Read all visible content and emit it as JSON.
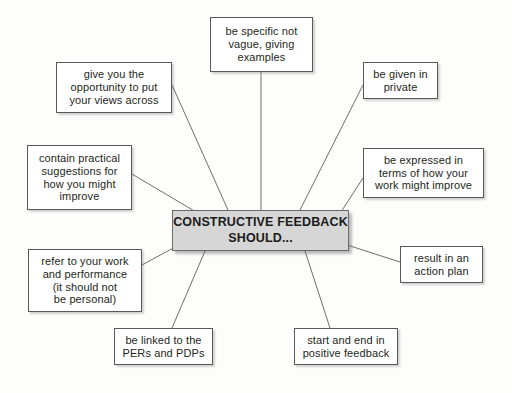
{
  "diagram": {
    "type": "radial-mind-map",
    "background_color": "#fdfdfc",
    "center": {
      "label": "CONSTRUCTIVE FEEDBACK\nSHOULD...",
      "fill_color": "#d6d6d6",
      "border_color": "#6a6a6c",
      "text_color": "#1b1b1b"
    },
    "node_style": {
      "fill_color": "#ffffff",
      "border_color": "#58585a",
      "text_color": "#231f20",
      "connector_color": "#6e6e70"
    },
    "nodes": [
      {
        "id": "be-specific",
        "label": "be specific not\nvague, giving\nexamples",
        "x": 210,
        "y": 17,
        "width": 103,
        "height": 55
      },
      {
        "id": "give-opportunity",
        "label": "give you the\nopportunity to put\nyour views across",
        "x": 56,
        "y": 62,
        "width": 116,
        "height": 51
      },
      {
        "id": "be-given-in-private",
        "label": "be given in\nprivate",
        "x": 363,
        "y": 62,
        "width": 75,
        "height": 37
      },
      {
        "id": "contain-practical-suggestions",
        "label": "contain practical\nsuggestions for\nhow you might\nimprove",
        "x": 27,
        "y": 145,
        "width": 105,
        "height": 65
      },
      {
        "id": "be-expressed-in-terms",
        "label": "be expressed in\nterms of how your\nwork might improve",
        "x": 363,
        "y": 148,
        "width": 121,
        "height": 50
      },
      {
        "id": "refer-to-your-work",
        "label": "refer to your work\nand performance\n(it should not\nbe personal)",
        "x": 28,
        "y": 249,
        "width": 114,
        "height": 63
      },
      {
        "id": "result-in-action-plan",
        "label": "result in an\naction plan",
        "x": 400,
        "y": 246,
        "width": 83,
        "height": 37
      },
      {
        "id": "be-linked-to-pers-pdps",
        "label": "be linked to the\nPERs and PDPs",
        "x": 114,
        "y": 328,
        "width": 99,
        "height": 37
      },
      {
        "id": "start-and-end-positive",
        "label": "start and end in\npositive feedback",
        "x": 294,
        "y": 328,
        "width": 104,
        "height": 37
      }
    ],
    "connectors": [
      {
        "id": "conn-be-specific",
        "x1": 261,
        "y1": 72,
        "x2": 261,
        "y2": 210
      },
      {
        "id": "conn-give-opportunity",
        "x1": 172,
        "y1": 85,
        "x2": 228,
        "y2": 210
      },
      {
        "id": "conn-be-given-in-private",
        "x1": 363,
        "y1": 85,
        "x2": 300,
        "y2": 210
      },
      {
        "id": "conn-contain-practical",
        "x1": 132,
        "y1": 174,
        "x2": 196,
        "y2": 212
      },
      {
        "id": "conn-be-expressed",
        "x1": 363,
        "y1": 178,
        "x2": 341,
        "y2": 212
      },
      {
        "id": "conn-refer-to-work",
        "x1": 142,
        "y1": 265,
        "x2": 177,
        "y2": 246
      },
      {
        "id": "conn-result-in-action-plan",
        "x1": 400,
        "y1": 262,
        "x2": 344,
        "y2": 244
      },
      {
        "id": "conn-be-linked-pers",
        "x1": 172,
        "y1": 328,
        "x2": 205,
        "y2": 251
      },
      {
        "id": "conn-start-end-positive",
        "x1": 330,
        "y1": 328,
        "x2": 305,
        "y2": 251
      }
    ]
  }
}
